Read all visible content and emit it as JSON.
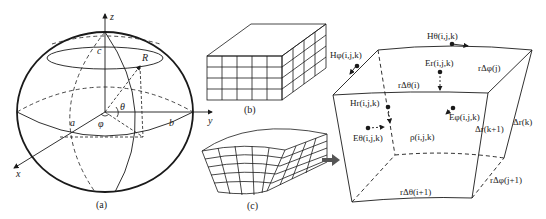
{
  "panel_a": {
    "caption": "(a)",
    "axis_z": "z",
    "axis_y": "y",
    "axis_x": "x",
    "label_c": "c",
    "label_R": "R",
    "label_theta": "θ",
    "label_phi": "φ",
    "label_a": "a",
    "label_b": "b"
  },
  "panel_b": {
    "caption": "(b)"
  },
  "panel_c": {
    "caption": "(c)"
  },
  "panel_cell": {
    "H_theta_top": "Hθ(i,j,k)",
    "H_phi_left": "Hφ(i,j,k)",
    "E_r": "Er(i,j,k)",
    "r_dphi_j": "rΔφ(j)",
    "r_dtheta_i": "rΔθ(i)",
    "H_r": "Hr(i,j,k)",
    "E_phi": "Eφ(i,j,k)",
    "E_theta": "Eθ(i,j,k)",
    "rho": "ρ(i,j,k)",
    "dr_k": "Δr(k)",
    "dr_k1": "Δr(k+1)",
    "r_dtheta_i1": "rΔθ(i+1)",
    "r_dphi_j1": "rΔφ(j+1)"
  },
  "colors": {
    "line": "#1a1a1a",
    "arrow": "#555555"
  }
}
